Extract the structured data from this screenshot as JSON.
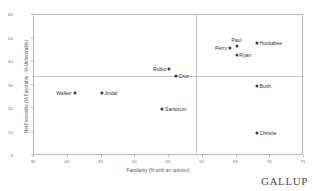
{
  "chart_data": {
    "type": "scatter",
    "title": "",
    "xlabel": "Familarity (% with an opinion)",
    "ylabel": "Net Favorable (% Favorable - % Unfavorable)",
    "xlim": [
      35,
      75
    ],
    "ylim": [
      0,
      60
    ],
    "xticks": [
      35,
      40,
      45,
      50,
      55,
      60,
      65,
      70,
      75
    ],
    "yticks": [
      0,
      10,
      20,
      30,
      40,
      50,
      60
    ],
    "grid": false,
    "legend": null,
    "reference_lines": {
      "horizontal": 34,
      "vertical": 59
    },
    "points": [
      {
        "label": "Walker",
        "x": 41,
        "y": 27,
        "label_pos": "left"
      },
      {
        "label": "Jindal",
        "x": 45,
        "y": 27,
        "label_pos": "right"
      },
      {
        "label": "Rubio",
        "x": 55,
        "y": 37,
        "label_pos": "left"
      },
      {
        "label": "Cruz",
        "x": 56,
        "y": 34,
        "label_pos": "right"
      },
      {
        "label": "Santorum",
        "x": 54,
        "y": 20,
        "label_pos": "right"
      },
      {
        "label": "Perry",
        "x": 64,
        "y": 46,
        "label_pos": "left"
      },
      {
        "label": "Paul",
        "x": 65,
        "y": 47,
        "label_pos": "above"
      },
      {
        "label": "Ryan",
        "x": 65,
        "y": 43,
        "label_pos": "right"
      },
      {
        "label": "Huckabee",
        "x": 68,
        "y": 48,
        "label_pos": "right"
      },
      {
        "label": "Bush",
        "x": 68,
        "y": 30,
        "label_pos": "right"
      },
      {
        "label": "Christie",
        "x": 68,
        "y": 10,
        "label_pos": "right"
      }
    ]
  },
  "brand": {
    "name": "GALLUP"
  },
  "colors": {
    "point": "#3b3b3b",
    "frame": "#b9b9b9",
    "reference": "#c3c3c3",
    "tick_text": "#6d6d6d",
    "axis_title": "#555555",
    "background": "#ffffff"
  }
}
